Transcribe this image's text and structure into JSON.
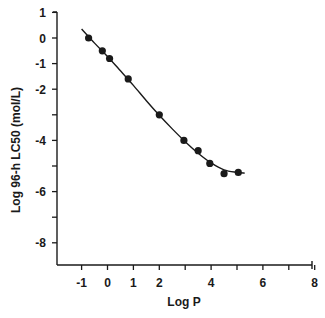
{
  "chart_data": {
    "type": "scatter",
    "title": "",
    "xlabel": "Log P",
    "ylabel": "Log 96-h LC50 (mol/L)",
    "xlim": [
      -1.9,
      8
    ],
    "ylim": [
      -8.9,
      1
    ],
    "grid": false,
    "legend": null,
    "x_ticks": [
      -1,
      0,
      1,
      2,
      3,
      4,
      5,
      6,
      7,
      8
    ],
    "x_tick_labels": [
      "-1",
      "0",
      "1",
      "2",
      "",
      "4",
      "",
      "6",
      "",
      "8"
    ],
    "y_ticks": [
      1,
      0,
      -1,
      -2,
      -3,
      -4,
      -5,
      -6,
      -7,
      -8
    ],
    "y_tick_labels": [
      "1",
      "0",
      "-1",
      "-2",
      "",
      "-4",
      "",
      "-6",
      "",
      "-8"
    ],
    "series": [
      {
        "name": "observed",
        "kind": "scatter",
        "marker": "filled-circle",
        "color": "#1a1a1a",
        "x": [
          -0.73,
          -0.2,
          0.08,
          0.8,
          2.0,
          2.95,
          3.5,
          3.95,
          4.5,
          5.05
        ],
        "y": [
          0.0,
          -0.5,
          -0.8,
          -1.6,
          -3.0,
          -4.0,
          -4.4,
          -4.9,
          -5.3,
          -5.25
        ]
      },
      {
        "name": "fitted curve",
        "kind": "line",
        "color": "#1a1a1a",
        "x": [
          -1.0,
          -0.5,
          0.0,
          0.5,
          1.0,
          1.5,
          2.0,
          2.5,
          3.0,
          3.5,
          4.0,
          4.5,
          5.0,
          5.3
        ],
        "y": [
          0.35,
          -0.2,
          -0.72,
          -1.28,
          -1.85,
          -2.45,
          -3.02,
          -3.55,
          -4.05,
          -4.5,
          -4.88,
          -5.15,
          -5.25,
          -5.28
        ]
      }
    ]
  }
}
